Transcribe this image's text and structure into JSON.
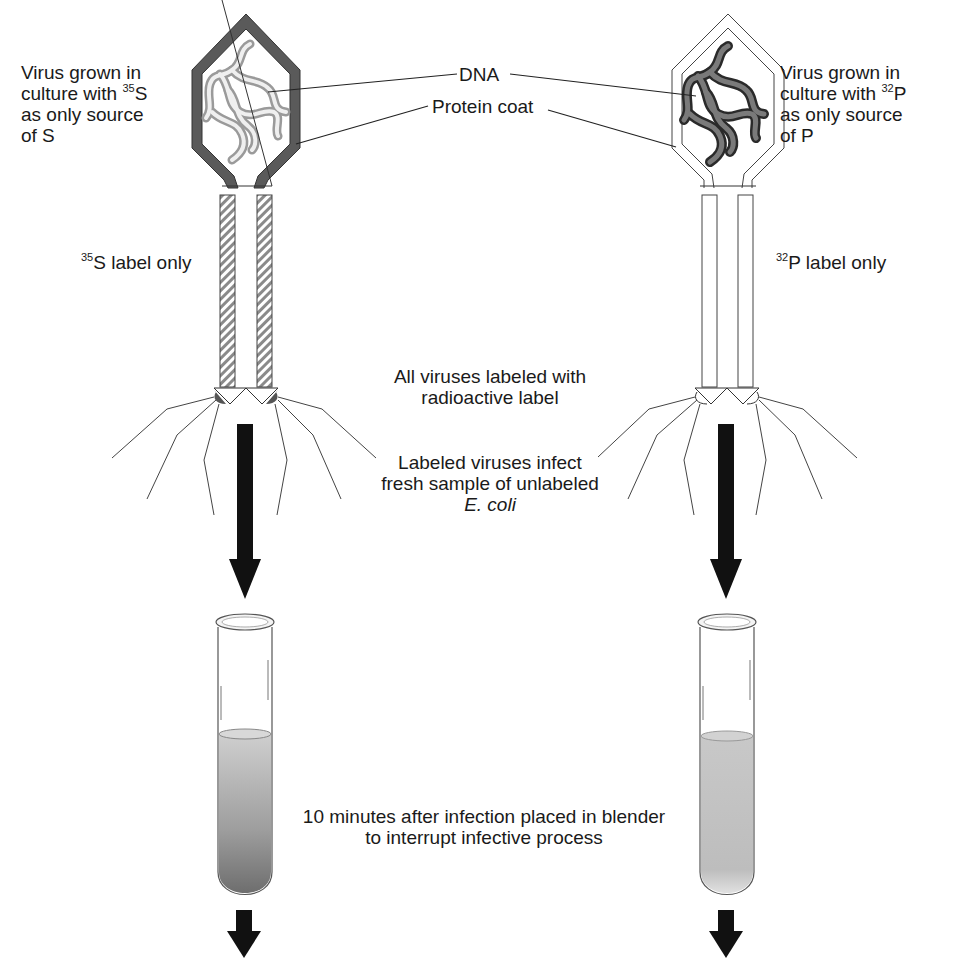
{
  "diagram": {
    "colors": {
      "ink": "#1a1a1a",
      "coat_dark": "#555555",
      "dna_light": "#c8c8c8",
      "dna_dark": "#4a4a4a",
      "arrow": "#111111",
      "culture_s35_top": "#c6c6c6",
      "culture_s35_bottom": "#7a7a7a",
      "culture_p32": "#c2c2c2"
    },
    "shared_labels": {
      "dna": "DNA",
      "protein_coat": "Protein coat"
    },
    "left_virus": {
      "growth_line1": "Virus grown  in",
      "growth_line2_prefix": "culture with ",
      "growth_isotope_mass": "35",
      "growth_isotope_symbol": "S",
      "growth_line3": "as only source",
      "growth_line4": "of S",
      "label_only_mass": "35",
      "label_only_text": "S label only"
    },
    "right_virus": {
      "growth_line1": "Virus grown  in",
      "growth_line2_prefix": "culture with ",
      "growth_isotope_mass": "32",
      "growth_isotope_symbol": "P",
      "growth_line3": "as only source",
      "growth_line4": "of P",
      "label_only_mass": "32",
      "label_only_text": "P label only"
    },
    "steps": {
      "all_labeled_line1": "All viruses labeled with",
      "all_labeled_line2": "radioactive label",
      "infect_line1": "Labeled viruses infect",
      "infect_line2": "fresh sample of unlabeled",
      "infect_line3": "E. coli",
      "blender_line1": "10 minutes after infection placed in blender",
      "blender_line2": "to interrupt infective process"
    }
  }
}
